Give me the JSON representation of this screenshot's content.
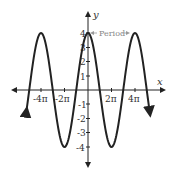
{
  "chart_data": {
    "type": "line",
    "title": "",
    "function": "y = 4cos(x/2)",
    "xlabel": "x",
    "ylabel": "y",
    "x_ticks": [
      "-4π",
      "-2π",
      "2π",
      "4π"
    ],
    "y_ticks": [
      "4",
      "3",
      "2",
      "1",
      "-1",
      "-2",
      "-3",
      "-4"
    ],
    "amplitude": 4,
    "period": "4π",
    "xlim": [
      "-5π",
      "5π"
    ],
    "ylim": [
      -4.5,
      4.5
    ],
    "annotation": "Period",
    "series": [
      {
        "name": "y = 4cos(x/2)",
        "points": [
          {
            "x": "-4π",
            "y": 4
          },
          {
            "x": "-3π",
            "y": 0
          },
          {
            "x": "-2π",
            "y": -4
          },
          {
            "x": "-π",
            "y": 0
          },
          {
            "x": "0",
            "y": 4
          },
          {
            "x": "π",
            "y": 0
          },
          {
            "x": "2π",
            "y": -4
          },
          {
            "x": "3π",
            "y": 0
          },
          {
            "x": "4π",
            "y": 4
          }
        ]
      }
    ],
    "grid": false,
    "line_color": "#222222"
  }
}
